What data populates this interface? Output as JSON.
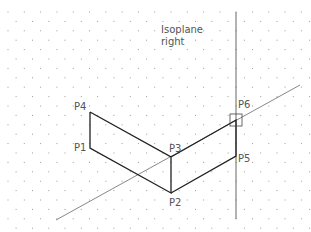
{
  "diagram": {
    "title_line1": "Isoplane",
    "title_line2": "right",
    "colors": {
      "background": "#ffffff",
      "object_line": "#222222",
      "construction_line": "#777777",
      "grid_dot": "#9a9a9a",
      "label": "#555555"
    },
    "grid": {
      "x_spacing": 16.3,
      "y_spacing": 9.4,
      "x_start": 8,
      "y_start": 12,
      "stagger": 8.15
    },
    "points": [
      {
        "name": "P1",
        "x": 90,
        "y": 148
      },
      {
        "name": "P2",
        "x": 171,
        "y": 193
      },
      {
        "name": "P3",
        "x": 171,
        "y": 157
      },
      {
        "name": "P4",
        "x": 90,
        "y": 112
      },
      {
        "name": "P5",
        "x": 236,
        "y": 156
      },
      {
        "name": "P6",
        "x": 236,
        "y": 120
      }
    ],
    "labels": {
      "P1": "P1",
      "P2": "P2",
      "P3": "P3",
      "P4": "P4",
      "P5": "P5",
      "P6": "P6"
    }
  }
}
